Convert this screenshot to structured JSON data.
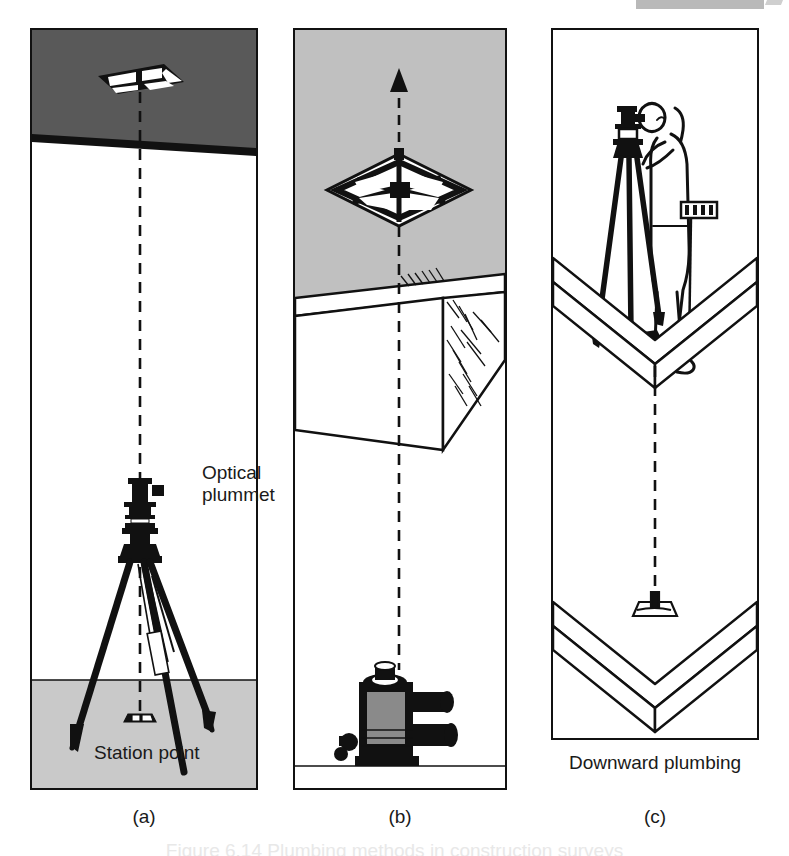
{
  "figure": {
    "kind": "technical-illustration",
    "cut_off_caption": "Figure 6.14 Plumbing methods in construction surveys"
  },
  "colors": {
    "ink": "#111111",
    "ceiling_dark_gray": "#595959",
    "wall_light_gray": "#c0c0c0",
    "ground_gray": "#c9c9c9",
    "paper_white": "#ffffff",
    "scan_artifact_gray": "#b9b9b9"
  },
  "panels": [
    {
      "id": "a",
      "sublabel": "(a)",
      "description": "Upward optical plummet from tripod-mounted theodolite to ceiling plate",
      "labels": {
        "instrument": "Optical\nplummet",
        "ground": "Station point"
      },
      "zones": {
        "ceiling": "dark gray ceiling slab",
        "room": "white wall space",
        "ground": "light gray ground"
      },
      "elements": [
        "ceiling-target-plate",
        "vertical-dashed-plumb-line",
        "theodolite-head",
        "tripod-legs",
        "station-point-marker"
      ]
    },
    {
      "id": "b",
      "sublabel": "(b)",
      "description": "Upward plumbing through a floor opening using a centring device",
      "labels": {
        "device": "Centring device",
        "line": "Optical\nplumb\nline"
      },
      "zones": {
        "upper": "light gray upper storey",
        "slab": "white concrete floor slab with hatched broken edge",
        "lower": "white lower storey"
      },
      "elements": [
        "upward-arrow",
        "centring-device-frame",
        "floor-slab",
        "hatched-break-edge",
        "vertical-dashed-plumb-line",
        "optical-plummet-instrument"
      ]
    },
    {
      "id": "c",
      "sublabel": "(c)",
      "description": "Downward plumbing from an upper floor slab to a reference point below",
      "labels": {
        "point": "Reference\npoint",
        "title": "Downward plumbing"
      },
      "zones": {
        "shaft": "white vertical shaft between two slabs"
      },
      "elements": [
        "surveyor-figure",
        "tripod-instrument",
        "levelling-staff",
        "upper-slab-corner",
        "vertical-dashed-plumb-line",
        "reference-point-marker",
        "lower-slab-corner"
      ]
    }
  ]
}
